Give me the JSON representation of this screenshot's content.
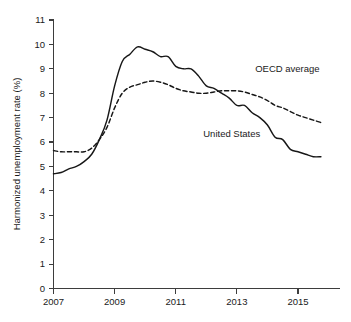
{
  "chart_data": {
    "type": "line",
    "title": "",
    "subtitle": "",
    "xlabel": "",
    "ylabel": "Harmonized unemployment rate (%)",
    "xlim": [
      2007,
      2015.9
    ],
    "ylim": [
      0,
      11
    ],
    "grid": false,
    "legend_position": "inline-annotations",
    "y_ticks": [
      0,
      1,
      2,
      3,
      4,
      5,
      6,
      7,
      8,
      9,
      10,
      11
    ],
    "y_tick_labels": [
      "0",
      "1",
      "2",
      "3",
      "4",
      "5",
      "6",
      "7",
      "8",
      "9",
      "10",
      "11"
    ],
    "x_ticks": [
      2007,
      2009,
      2011,
      2013,
      2015
    ],
    "x_tick_labels": [
      "2007",
      "2009",
      "2011",
      "2013",
      "2015"
    ],
    "annotations": [
      {
        "text": "OECD average",
        "x": 2013.6,
        "y": 8.85,
        "series": "OECD average"
      },
      {
        "text": "United States",
        "x": 2011.9,
        "y": 6.2,
        "series": "United States"
      }
    ],
    "series": [
      {
        "name": "United States",
        "style": "solid",
        "color": "#171717",
        "x": [
          2007.0,
          2007.25,
          2007.5,
          2007.75,
          2008.0,
          2008.25,
          2008.5,
          2008.75,
          2009.0,
          2009.25,
          2009.5,
          2009.75,
          2010.0,
          2010.25,
          2010.5,
          2010.75,
          2011.0,
          2011.25,
          2011.5,
          2011.75,
          2012.0,
          2012.25,
          2012.5,
          2012.75,
          2013.0,
          2013.25,
          2013.5,
          2013.75,
          2014.0,
          2014.25,
          2014.5,
          2014.75,
          2015.0,
          2015.25,
          2015.5,
          2015.75
        ],
        "y": [
          4.7,
          4.75,
          4.9,
          5.0,
          5.2,
          5.5,
          6.1,
          6.9,
          8.3,
          9.3,
          9.6,
          9.9,
          9.8,
          9.7,
          9.5,
          9.5,
          9.1,
          9.0,
          9.0,
          8.7,
          8.3,
          8.2,
          8.0,
          7.8,
          7.5,
          7.5,
          7.2,
          7.0,
          6.7,
          6.2,
          6.1,
          5.7,
          5.6,
          5.5,
          5.4,
          5.4
        ]
      },
      {
        "name": "OECD average",
        "style": "dashed",
        "color": "#171717",
        "x": [
          2007.0,
          2007.25,
          2007.5,
          2007.75,
          2008.0,
          2008.25,
          2008.5,
          2008.75,
          2009.0,
          2009.25,
          2009.5,
          2009.75,
          2010.0,
          2010.25,
          2010.5,
          2010.75,
          2011.0,
          2011.25,
          2011.5,
          2011.75,
          2012.0,
          2012.25,
          2012.5,
          2012.75,
          2013.0,
          2013.25,
          2013.5,
          2013.75,
          2014.0,
          2014.25,
          2014.5,
          2014.75,
          2015.0,
          2015.25,
          2015.5,
          2015.75
        ],
        "y": [
          5.65,
          5.6,
          5.6,
          5.6,
          5.6,
          5.75,
          6.1,
          6.6,
          7.4,
          8.0,
          8.25,
          8.35,
          8.45,
          8.5,
          8.45,
          8.35,
          8.2,
          8.1,
          8.05,
          8.0,
          8.0,
          8.05,
          8.1,
          8.1,
          8.1,
          8.05,
          7.95,
          7.85,
          7.7,
          7.5,
          7.4,
          7.25,
          7.1,
          7.0,
          6.9,
          6.8
        ]
      }
    ]
  },
  "caption": {
    "sliver": ""
  }
}
